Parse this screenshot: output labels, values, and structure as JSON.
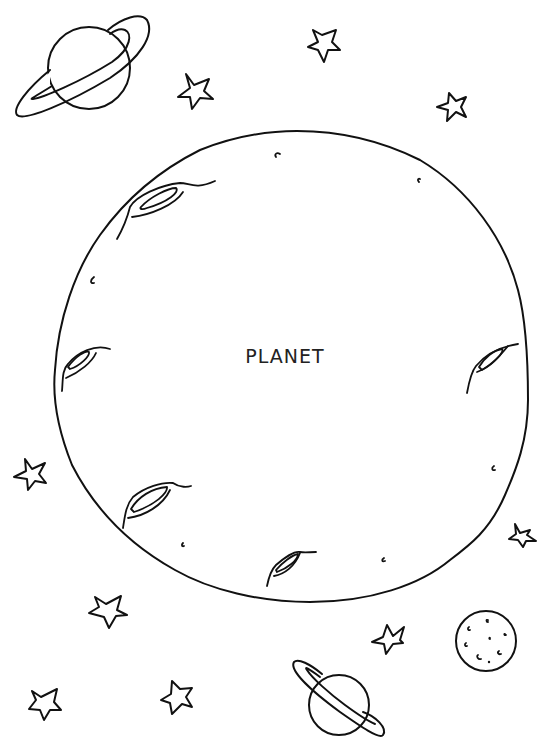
{
  "page": {
    "type": "coloring-page",
    "background": "#ffffff",
    "ink_color": "#111111"
  },
  "main_planet": {
    "label": "PLANET",
    "craters": 5,
    "small_marks": 8
  },
  "decorations": {
    "ringed_planets": 2,
    "small_moon": 1,
    "stars": 10
  }
}
